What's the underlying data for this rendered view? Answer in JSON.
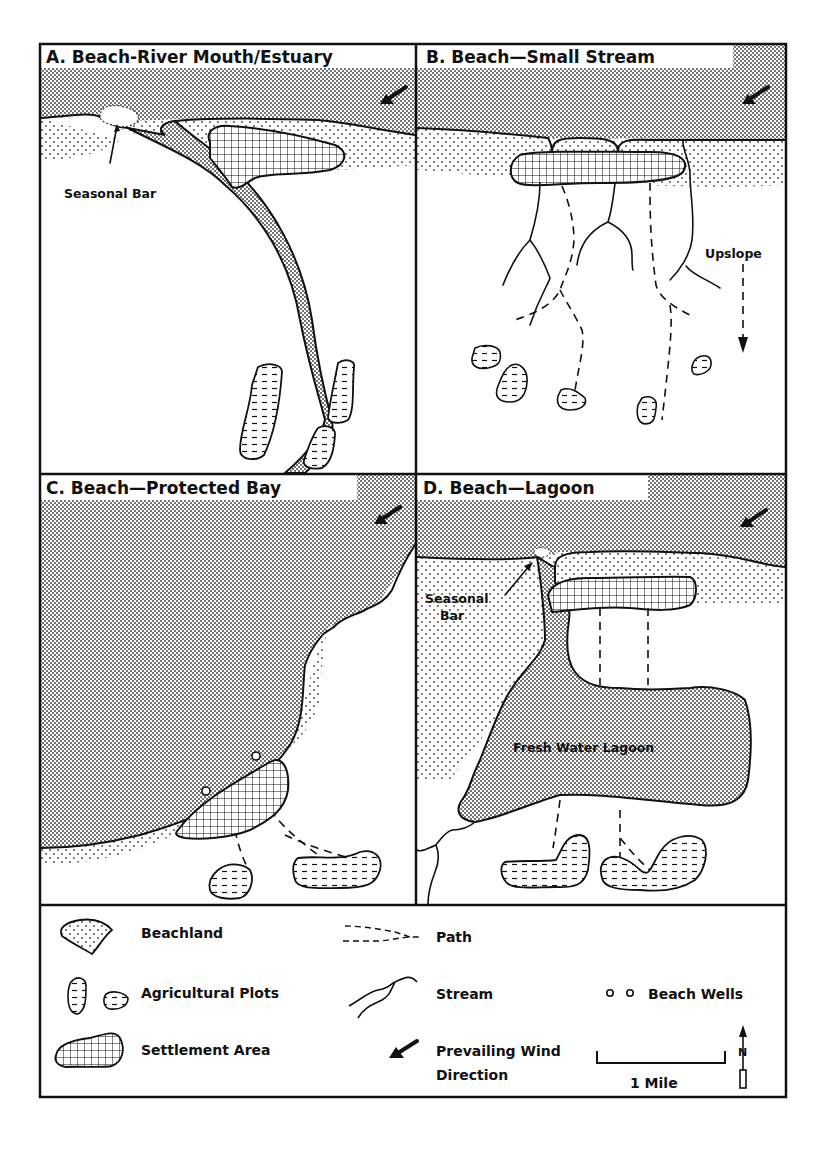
{
  "figure": {
    "panels": [
      {
        "id": "A",
        "title": "A. Beach-River Mouth/Estuary",
        "labels": [
          "Seasonal Bar"
        ]
      },
      {
        "id": "B",
        "title": "B. Beach—Small Stream",
        "labels": [
          "Upslope"
        ]
      },
      {
        "id": "C",
        "title": "C. Beach—Protected Bay",
        "labels": []
      },
      {
        "id": "D",
        "title": "D. Beach—Lagoon",
        "labels": [
          "Seasonal",
          "Bar",
          "Fresh Water Lagoon"
        ]
      }
    ],
    "legend": {
      "beachland": "Beachland",
      "agricultural_plots": "Agricultural Plots",
      "settlement_area": "Settlement Area",
      "path": "Path",
      "stream": "Stream",
      "prevailing_wind_line1": "Prevailing Wind",
      "prevailing_wind_line2": "Direction",
      "beach_wells": "Beach Wells",
      "scale": "1 Mile",
      "north": "N"
    },
    "icons": {
      "wind": "arrow-southwest-icon",
      "well": "circle-icon",
      "north": "north-arrow-icon"
    }
  }
}
